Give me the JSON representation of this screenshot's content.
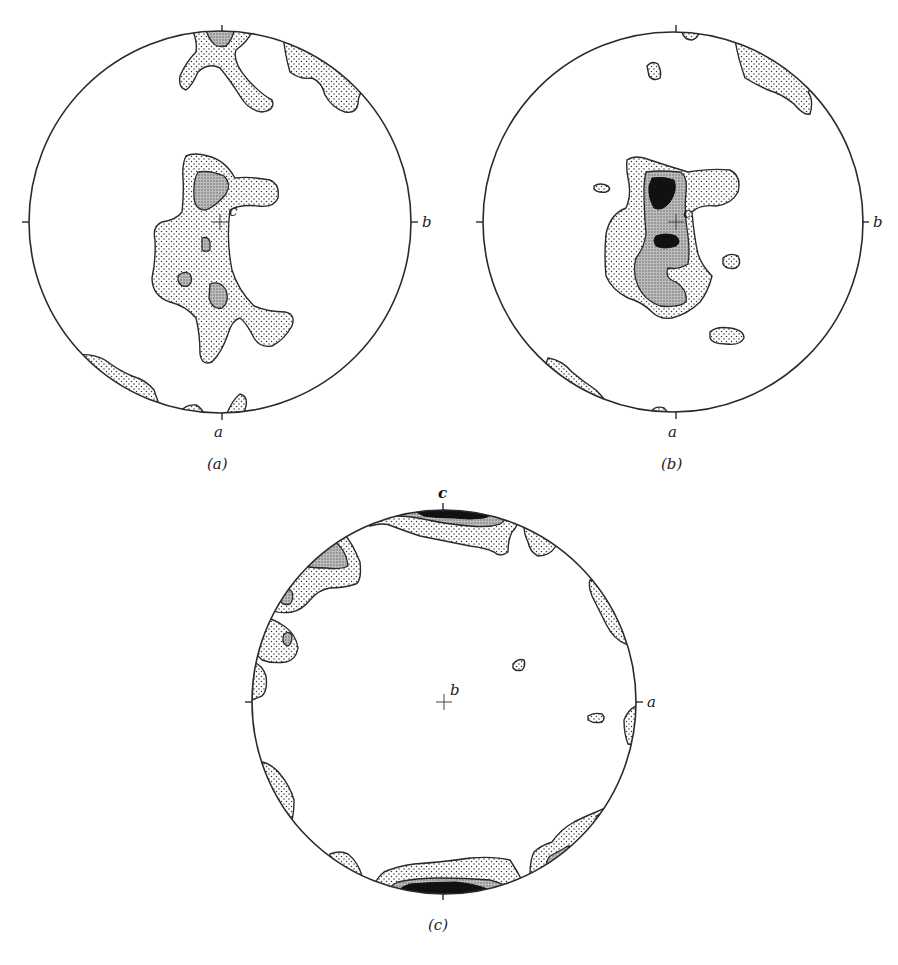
{
  "figure": {
    "panels": [
      {
        "id": "a",
        "caption": "(a)",
        "center_label": "c",
        "right_label": "b",
        "bottom_label": "a",
        "top_label": "",
        "contour_levels": [
          "light stipple",
          "dense stipple"
        ]
      },
      {
        "id": "b",
        "caption": "(b)",
        "center_label": "c",
        "right_label": "b",
        "bottom_label": "a",
        "top_label": "",
        "contour_levels": [
          "light stipple",
          "dense stipple",
          "solid black"
        ]
      },
      {
        "id": "c",
        "caption": "(c)",
        "center_label": "b",
        "right_label": "a",
        "bottom_label": "",
        "top_label": "c",
        "contour_levels": [
          "light stipple",
          "dense stipple",
          "solid black"
        ]
      }
    ],
    "colors": {
      "ink": "#2a2a2a",
      "fill_max": "#111111",
      "background": "#ffffff"
    }
  }
}
